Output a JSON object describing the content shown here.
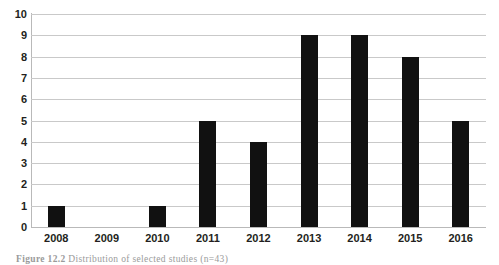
{
  "chart_data": {
    "type": "bar",
    "title": "",
    "xlabel": "",
    "ylabel": "",
    "categories": [
      "2008",
      "2009",
      "2010",
      "2011",
      "2012",
      "2013",
      "2014",
      "2015",
      "2016"
    ],
    "values": [
      1,
      0,
      1,
      5,
      4,
      9,
      9,
      8,
      5
    ],
    "ylim": [
      0,
      10
    ],
    "ytick_step": 1,
    "yticks": [
      "10",
      "9",
      "8",
      "7",
      "6",
      "5",
      "4",
      "3",
      "2",
      "1",
      "0"
    ],
    "grid": true,
    "legend": false,
    "bar_color": "#111111",
    "grid_color": "#c9c9c9",
    "axis_color": "#b9b9b9",
    "series": [
      {
        "name": "Selected studies",
        "values": [
          1,
          0,
          1,
          5,
          4,
          9,
          9,
          8,
          5
        ]
      }
    ]
  },
  "caption": {
    "label": "Figure 12.2",
    "text": "Distribution of selected studies (n=43)",
    "full": "Figure 12.2  Distribution of selected studies (n=43)"
  }
}
